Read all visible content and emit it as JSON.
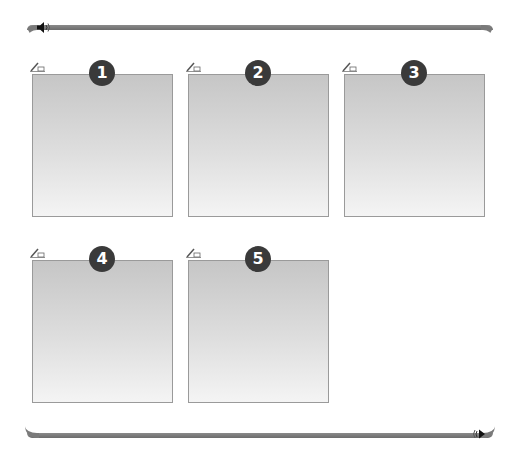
{
  "header": {
    "audio_icon": "speaker-icon"
  },
  "footer": {
    "next_icon": "play-next-icon"
  },
  "panels": [
    {
      "number": "1",
      "edit_icon": "pencil-note-icon"
    },
    {
      "number": "2",
      "edit_icon": "pencil-note-icon"
    },
    {
      "number": "3",
      "edit_icon": "pencil-note-icon"
    },
    {
      "number": "4",
      "edit_icon": "pencil-note-icon"
    },
    {
      "number": "5",
      "edit_icon": "pencil-note-icon"
    }
  ],
  "colors": {
    "bar": "#7a7a7a",
    "badge": "#3a3a3a",
    "panel_top": "#c6c6c6",
    "panel_bottom": "#f4f4f4",
    "panel_border": "#9a9a9a"
  }
}
